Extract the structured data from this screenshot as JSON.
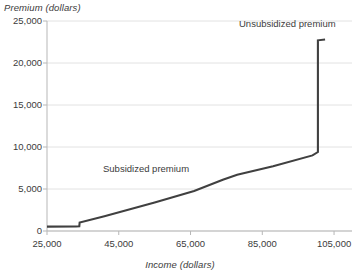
{
  "chart_data": {
    "type": "line",
    "title": "",
    "xlabel": "Income (dollars)",
    "ylabel": "Premium (dollars)",
    "xlim": [
      25000,
      110000
    ],
    "ylim": [
      0,
      25000
    ],
    "grid": true,
    "legend_position": "inline-annotations",
    "x_ticks": [
      "25,000",
      "45,000",
      "65,000",
      "85,000",
      "105,000"
    ],
    "x_tick_values": [
      25000,
      45000,
      65000,
      85000,
      105000
    ],
    "y_ticks": [
      "0",
      "5,000",
      "10,000",
      "15,000",
      "20,000",
      "25,000"
    ],
    "y_tick_values": [
      0,
      5000,
      10000,
      15000,
      20000,
      25000
    ],
    "series": [
      {
        "name": "Premium",
        "color": "#404040",
        "points": [
          {
            "x": 25000,
            "y": 520
          },
          {
            "x": 33000,
            "y": 540
          },
          {
            "x": 34000,
            "y": 560
          },
          {
            "x": 34100,
            "y": 1000
          },
          {
            "x": 41000,
            "y": 1750
          },
          {
            "x": 55000,
            "y": 3400
          },
          {
            "x": 66000,
            "y": 4750
          },
          {
            "x": 74000,
            "y": 6100
          },
          {
            "x": 78000,
            "y": 6700
          },
          {
            "x": 88000,
            "y": 7700
          },
          {
            "x": 99000,
            "y": 9000
          },
          {
            "x": 100500,
            "y": 9400
          },
          {
            "x": 100500,
            "y": 22700
          },
          {
            "x": 102500,
            "y": 22800
          }
        ]
      }
    ],
    "annotations": [
      {
        "text": "Subsidized premium",
        "x": 48000,
        "y": 7000
      },
      {
        "text": "Unsubsidized premium",
        "x": 86000,
        "y": 24200
      }
    ]
  },
  "colors": {
    "line": "#404040",
    "grid": "#e2e2e2",
    "axis": "#b7b7b7",
    "text": "#3b3b3b",
    "background": "#ffffff"
  }
}
